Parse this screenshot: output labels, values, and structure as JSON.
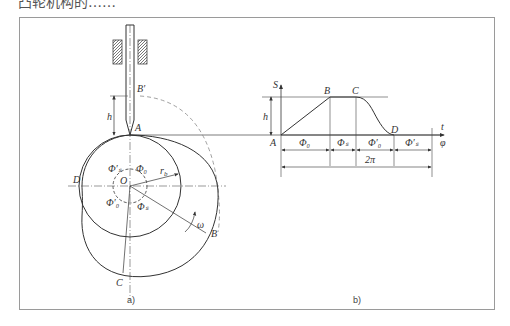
{
  "figure": {
    "top_caption_partial": "凸轮机构的……",
    "panel_a": {
      "caption": "a)",
      "labels": {
        "B_prime": "B′",
        "h": "h",
        "A": "A",
        "O": "O",
        "r_b": "r",
        "r_b_sub": "b",
        "D": "D",
        "B": "B",
        "C": "C",
        "omega": "ω",
        "phi0": "Φ₀",
        "phis": "Φₛ",
        "phi0_prime": "Φ′₀",
        "phis_prime": "Φ′ₛ"
      }
    },
    "panel_b": {
      "caption": "b)",
      "labels": {
        "S": "S",
        "h": "h",
        "A": "A",
        "B": "B",
        "C": "C",
        "D": "D",
        "t": "t",
        "phi": "φ",
        "seg_phi0": "Φ₀",
        "seg_phis": "Φₛ",
        "seg_phi0_prime": "Φ′₀",
        "seg_phis_prime": "Φ′ₛ",
        "total": "2π"
      }
    }
  },
  "colors": {
    "line": "#333333",
    "frame": "#9a9a9a",
    "dashed": "#888888"
  }
}
